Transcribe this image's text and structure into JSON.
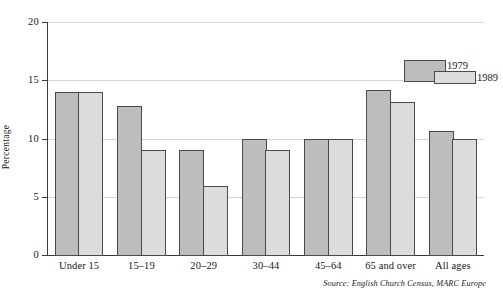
{
  "chart_data": {
    "type": "bar",
    "title": "",
    "xlabel": "",
    "ylabel": "Percentage",
    "ylim": [
      0,
      20
    ],
    "yticks": [
      0,
      5,
      10,
      15,
      20
    ],
    "ytick_labels": [
      "0",
      "5",
      "10",
      "15",
      "20"
    ],
    "grid": true,
    "legend_position": "upper-right",
    "categories": [
      "Under 15",
      "15–19",
      "20–29",
      "30–44",
      "45–64",
      "65 and over",
      "All ages"
    ],
    "series": [
      {
        "name": "1979",
        "color": "#bdbdbd",
        "values": [
          14.0,
          12.8,
          9.1,
          10.0,
          10.0,
          14.2,
          10.7
        ]
      },
      {
        "name": "1989",
        "color": "#dcdcdc",
        "values": [
          14.0,
          9.1,
          6.0,
          9.1,
          10.0,
          13.2,
          10.0
        ]
      }
    ],
    "source_note": "Source: English Church Census, MARC Europe"
  },
  "axis": {
    "y_title": "Percentage",
    "y_tick_labels": [
      "20",
      "15",
      "10",
      "5",
      "0"
    ]
  },
  "legend": {
    "entries": [
      {
        "label": "1979"
      },
      {
        "label": "1989"
      }
    ]
  },
  "footer": {
    "source": "Source: English Church Census, MARC Europe"
  }
}
